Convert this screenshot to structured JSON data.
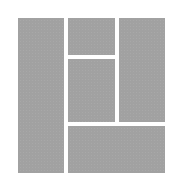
{
  "diagram": {
    "type": "layout-grid-icon",
    "background": "#ffffff",
    "tile_color": "#a9a9a9",
    "tiles": [
      {
        "id": "left-column",
        "x": 18,
        "y": 18,
        "w": 46,
        "h": 155
      },
      {
        "id": "middle-top",
        "x": 68,
        "y": 18,
        "w": 47,
        "h": 37
      },
      {
        "id": "middle-lower",
        "x": 68,
        "y": 59,
        "w": 47,
        "h": 63
      },
      {
        "id": "right-column",
        "x": 119,
        "y": 18,
        "w": 46,
        "h": 104
      },
      {
        "id": "bottom-wide",
        "x": 68,
        "y": 126,
        "w": 97,
        "h": 47
      }
    ]
  }
}
